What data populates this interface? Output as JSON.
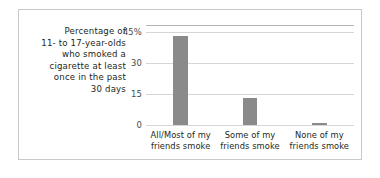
{
  "chart_data": {
    "type": "bar",
    "title": "",
    "subtitle": "",
    "caption_lines": [
      "Percentage of",
      "11- to 17-year-olds",
      "who smoked a",
      "cigarette at least",
      "once in the past",
      "30 days"
    ],
    "categories": [
      "All/Most of my friends smoke",
      "Some of my friends smoke",
      "None of my friends smoke"
    ],
    "category_lines": [
      [
        "All/Most of my",
        "friends smoke"
      ],
      [
        "Some of my",
        "friends smoke"
      ],
      [
        "None of my",
        "friends smoke"
      ]
    ],
    "values": [
      43,
      13,
      1
    ],
    "xlabel": "",
    "ylabel": "Percentage of 11- to 17-year-olds who smoked a cigarette at least once in the past 30 days",
    "ylim": [
      0,
      48
    ],
    "yticks": [
      0,
      15,
      30,
      45
    ],
    "ytick_labels": [
      "0",
      "15",
      "30",
      "45%"
    ],
    "grid": true,
    "legend": false,
    "legend_position": "none",
    "colors": {
      "bar": "#8a8a8a",
      "gridline": "#d6d6d6",
      "axis_line": "#b4b4b4",
      "frame_border": "#c9c9c9",
      "text": "#231f20",
      "tick_text": "#4a4a4a",
      "background": "#ffffff"
    }
  }
}
